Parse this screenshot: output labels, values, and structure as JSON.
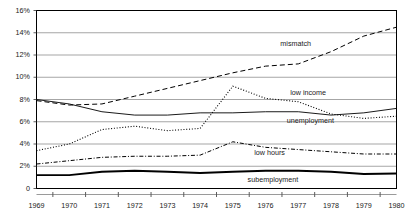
{
  "chart_data": {
    "type": "line",
    "title": "",
    "xlabel": "",
    "ylabel": "",
    "x": [
      1969,
      1970,
      1971,
      1972,
      1973,
      1974,
      1975,
      1976,
      1977,
      1978,
      1979,
      1980
    ],
    "xtick_labels": [
      "1969",
      "1970",
      "1971",
      "1972",
      "1973",
      "1974",
      "1975",
      "1976",
      "1977",
      "1978",
      "1979",
      "1980"
    ],
    "ytick_labels": [
      "0",
      "2%",
      "4%",
      "6%",
      "8%",
      "10%",
      "12%",
      "14%",
      "16%"
    ],
    "ytick_values": [
      0,
      2,
      4,
      6,
      8,
      10,
      12,
      14,
      16
    ],
    "ylim": [
      0,
      16
    ],
    "xlim": [
      1969,
      1980
    ],
    "grid": true,
    "grid_color": "#808080",
    "frame_color": "#000000",
    "legend_position": "inline-right",
    "series": [
      {
        "name": "mismatch",
        "label": "mismatch",
        "style": "dashed",
        "color": "#000000",
        "label_x": 1977.0,
        "label_y": 13.0,
        "values": [
          7.9,
          7.5,
          7.6,
          8.3,
          9.0,
          9.7,
          10.4,
          11.0,
          11.2,
          12.3,
          13.7,
          14.5
        ]
      },
      {
        "name": "low income",
        "label": "low income",
        "style": "solid",
        "color": "#000000",
        "label_x": 1977.3,
        "label_y": 8.55,
        "values": [
          8.0,
          7.6,
          6.9,
          6.6,
          6.6,
          6.8,
          6.8,
          6.9,
          6.9,
          6.6,
          6.8,
          7.2
        ]
      },
      {
        "name": "unemployment",
        "label": "unemployment",
        "style": "dotted",
        "color": "#000000",
        "label_x": 1977.2,
        "label_y": 6.1,
        "values": [
          3.4,
          4.0,
          5.3,
          5.6,
          5.2,
          5.4,
          9.2,
          8.1,
          7.8,
          6.7,
          6.3,
          6.5
        ]
      },
      {
        "name": "low hours",
        "label": "low hours",
        "style": "dashdot",
        "color": "#000000",
        "label_x": 1976.2,
        "label_y": 3.15,
        "values": [
          2.2,
          2.5,
          2.8,
          2.9,
          2.9,
          3.0,
          4.2,
          3.7,
          3.5,
          3.3,
          3.1,
          3.1
        ]
      },
      {
        "name": "subemployment",
        "label": "subemployment",
        "style": "thick-solid",
        "color": "#000000",
        "label_x": 1976.0,
        "label_y": 0.75,
        "values": [
          1.2,
          1.2,
          1.5,
          1.6,
          1.5,
          1.4,
          1.5,
          1.6,
          1.6,
          1.5,
          1.3,
          1.35
        ]
      }
    ]
  }
}
